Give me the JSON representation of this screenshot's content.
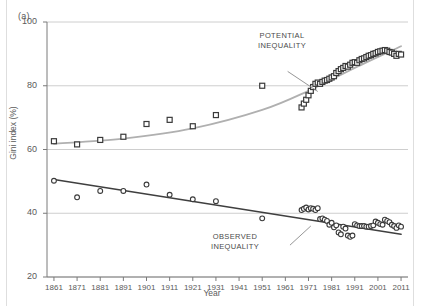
{
  "figure": {
    "panel_label": "(a)",
    "xlabel": "Year",
    "ylabel": "Gini index (%)"
  },
  "annotations": {
    "potential": "POTENTIAL\nINEQUALITY",
    "observed": "OBSERVED\nINEQUALITY"
  },
  "colors": {
    "potential_line": "#b0b0b0",
    "potential_marker_edge": "#3a3a3a",
    "observed_line": "#3f3f3f",
    "observed_marker_edge": "#3a3a3a",
    "grid": "#c8c8c8",
    "axis": "#7a7a7a",
    "text": "#5a5a5a"
  },
  "chart_data": {
    "type": "scatter",
    "title": "",
    "xlabel": "Year",
    "ylabel": "Gini index (%)",
    "xlim": [
      1858,
      2014
    ],
    "ylim": [
      20,
      100
    ],
    "yticks": [
      20,
      40,
      60,
      80,
      100
    ],
    "xticks": [
      1861,
      1871,
      1881,
      1891,
      1901,
      1911,
      1921,
      1931,
      1941,
      1951,
      1961,
      1971,
      1981,
      1991,
      2001,
      2011
    ],
    "grid": "horizontal",
    "legend": "annotated-inline",
    "series": [
      {
        "name": "POTENTIAL INEQUALITY",
        "marker": "square",
        "color": "#b0b0b0",
        "trend": "smooth-rising-curve",
        "points": [
          [
            1861,
            62.6
          ],
          [
            1871,
            61.6
          ],
          [
            1881,
            63.0
          ],
          [
            1891,
            64.0
          ],
          [
            1901,
            68.0
          ],
          [
            1911,
            69.3
          ],
          [
            1921,
            67.3
          ],
          [
            1931,
            70.8
          ],
          [
            1951,
            80.0
          ],
          [
            1968,
            73.2
          ],
          [
            1969,
            74.4
          ],
          [
            1970,
            75.6
          ],
          [
            1971,
            77.0
          ],
          [
            1972,
            78.4
          ],
          [
            1973,
            79.6
          ],
          [
            1974,
            80.6
          ],
          [
            1975,
            81.0
          ],
          [
            1976,
            80.6
          ],
          [
            1977,
            81.2
          ],
          [
            1978,
            81.6
          ],
          [
            1979,
            81.8
          ],
          [
            1980,
            82.2
          ],
          [
            1981,
            82.6
          ],
          [
            1982,
            83.0
          ],
          [
            1983,
            84.0
          ],
          [
            1984,
            84.6
          ],
          [
            1985,
            85.2
          ],
          [
            1986,
            85.6
          ],
          [
            1987,
            86.2
          ],
          [
            1988,
            86.0
          ],
          [
            1989,
            86.6
          ],
          [
            1990,
            87.2
          ],
          [
            1991,
            87.4
          ],
          [
            1992,
            87.2
          ],
          [
            1993,
            88.0
          ],
          [
            1994,
            88.4
          ],
          [
            1995,
            88.6
          ],
          [
            1996,
            89.0
          ],
          [
            1997,
            89.4
          ],
          [
            1998,
            89.6
          ],
          [
            1999,
            90.0
          ],
          [
            2000,
            90.2
          ],
          [
            2001,
            90.6
          ],
          [
            2002,
            90.8
          ],
          [
            2003,
            91.0
          ],
          [
            2004,
            91.2
          ],
          [
            2005,
            91.0
          ],
          [
            2006,
            90.6
          ],
          [
            2007,
            90.4
          ],
          [
            2008,
            90.0
          ],
          [
            2009,
            89.4
          ],
          [
            2010,
            90.0
          ],
          [
            2011,
            89.8
          ]
        ],
        "trendline": {
          "type": "curve",
          "anchor_points": [
            [
              1861,
              61.8
            ],
            [
              1891,
              63.4
            ],
            [
              1921,
              66.6
            ],
            [
              1951,
              72.4
            ],
            [
              1971,
              78.4
            ],
            [
              1991,
              85.6
            ],
            [
              2011,
              92.4
            ]
          ]
        }
      },
      {
        "name": "OBSERVED INEQUALITY",
        "marker": "circle",
        "color": "#3f3f3f",
        "trend": "linear-declining",
        "points": [
          [
            1861,
            50.2
          ],
          [
            1871,
            45.0
          ],
          [
            1881,
            47.0
          ],
          [
            1891,
            47.0
          ],
          [
            1901,
            49.0
          ],
          [
            1911,
            45.8
          ],
          [
            1921,
            44.4
          ],
          [
            1931,
            43.8
          ],
          [
            1951,
            38.4
          ],
          [
            1968,
            41.0
          ],
          [
            1969,
            41.4
          ],
          [
            1970,
            41.8
          ],
          [
            1971,
            41.2
          ],
          [
            1972,
            41.6
          ],
          [
            1973,
            41.4
          ],
          [
            1974,
            41.0
          ],
          [
            1975,
            41.6
          ],
          [
            1976,
            38.2
          ],
          [
            1977,
            38.4
          ],
          [
            1978,
            38.0
          ],
          [
            1979,
            37.6
          ],
          [
            1980,
            36.4
          ],
          [
            1981,
            37.0
          ],
          [
            1982,
            35.6
          ],
          [
            1983,
            36.2
          ],
          [
            1984,
            34.0
          ],
          [
            1985,
            33.4
          ],
          [
            1986,
            35.8
          ],
          [
            1987,
            35.2
          ],
          [
            1988,
            33.0
          ],
          [
            1989,
            32.6
          ],
          [
            1990,
            33.0
          ],
          [
            1991,
            36.6
          ],
          [
            1992,
            36.2
          ],
          [
            1993,
            36.0
          ],
          [
            1994,
            36.0
          ],
          [
            1995,
            36.0
          ],
          [
            1996,
            35.8
          ],
          [
            1997,
            35.8
          ],
          [
            1998,
            36.0
          ],
          [
            1999,
            36.2
          ],
          [
            2000,
            37.4
          ],
          [
            2001,
            37.0
          ],
          [
            2002,
            36.6
          ],
          [
            2003,
            36.4
          ],
          [
            2004,
            38.0
          ],
          [
            2005,
            37.6
          ],
          [
            2006,
            37.2
          ],
          [
            2007,
            36.4
          ],
          [
            2008,
            36.0
          ],
          [
            2009,
            35.4
          ],
          [
            2010,
            36.2
          ],
          [
            2011,
            35.8
          ]
        ],
        "trendline": {
          "type": "line",
          "anchor_points": [
            [
              1861,
              50.6
            ],
            [
              2011,
              33.4
            ]
          ]
        }
      }
    ],
    "annotation_leaders": [
      {
        "label": "POTENTIAL INEQUALITY",
        "from": [
          1962,
          84.5
        ],
        "to": [
          1975,
          78.2
        ]
      },
      {
        "label": "OBSERVED INEQUALITY",
        "from": [
          1963,
          30.0
        ],
        "to": [
          1972,
          36.0
        ]
      }
    ]
  }
}
